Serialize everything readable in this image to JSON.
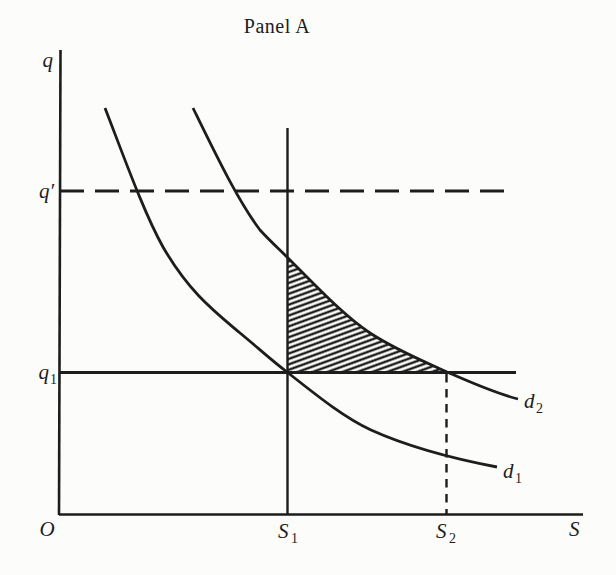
{
  "title": "Panel A",
  "colors": {
    "ink": "#1d1d1d",
    "paper": "#fcfcfa"
  },
  "axis_labels": {
    "y": "q",
    "x": "S",
    "origin": "O"
  },
  "line_labels": {
    "q_prime": "q′",
    "q1_main": "q",
    "q1_sub": "1",
    "s1_main": "S",
    "s1_sub": "1",
    "s2_main": "S",
    "s2_sub": "2"
  },
  "curve_labels": {
    "d1_main": "d",
    "d1_sub": "1",
    "d2_main": "d",
    "d2_sub": "2"
  },
  "geometry": {
    "y_axis": "M 60.5 50 L 59 515",
    "x_axis": "M 59 514.5 L 583 514.5",
    "q_prime_line": "M 60 191 L 515 191",
    "q1_line": "M 60 372.5 L 516 372.5",
    "s1_line": "M 287.5 128 L 287.5 514",
    "s2_line": "M 446.5 374 L 446.5 514",
    "d1_curve": "M 105 108 C 124 157 144 213 163 247 C 189 292 214 311 240 333 C 256 346 271 360 287 372 C 315 394 343 417 371 430 C 413 449 455 459 497 467",
    "d2_curve": "M 193 108 C 215 153 238 201 260 230 C 270 241 279 249 288 258 C 315 285 343 315 370 333 C 396 350 421 360 447 372 C 470 382 494 393 518 399",
    "shaded_region": "M 288 258 L 288 372 L 447 372 C 421 360 396 350 370 333 C 343 315 315 285 288 258 Z"
  }
}
